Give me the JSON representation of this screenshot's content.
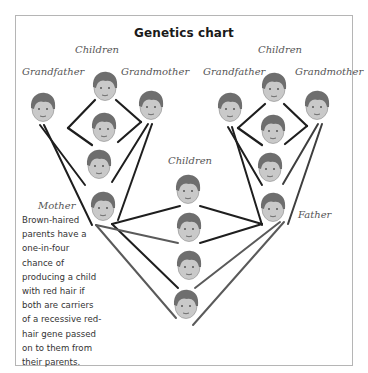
{
  "chart": {
    "title": "Genetics chart",
    "labels": {
      "children_left": "Children",
      "children_right": "Children",
      "children_center": "Children",
      "grandfather_left": "Grandfather",
      "grandmother_left": "Grandmother",
      "grandfather_right": "Grandfather",
      "grandmother_right": "Grandmother",
      "mother": "Mother",
      "father": "Father"
    },
    "caption": "Brown-haired parents have a one-in-four chance of producing a child with red hair if both are carriers of a recessive red-hair gene passed on to them from their parents."
  },
  "colors": {
    "hair": "#6e6e6e",
    "face": "#c9c9c9",
    "line_dark": "#1e1e1e",
    "line_gray": "#5a5a5a",
    "border": "#b5b5b5"
  },
  "nodes": {
    "left_family": [
      "Grandfather",
      "Grandmother",
      "Child",
      "Child",
      "Child",
      "Mother"
    ],
    "right_family": [
      "Grandfather",
      "Grandmother",
      "Child",
      "Child",
      "Child",
      "Father"
    ],
    "center_children": [
      "Child",
      "Child",
      "Child",
      "Child"
    ]
  }
}
